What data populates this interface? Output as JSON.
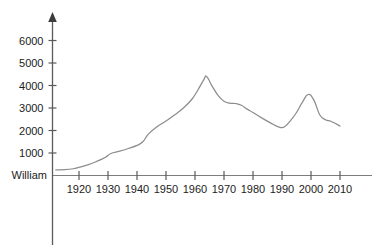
{
  "chart_data": {
    "type": "line",
    "title": "",
    "xlabel": "",
    "ylabel": "",
    "baseline_label": "William",
    "xlim": [
      1912,
      2014
    ],
    "ylim": [
      0,
      6800
    ],
    "grid": false,
    "legend": "none",
    "y_ticks": [
      1000,
      2000,
      3000,
      4000,
      5000,
      6000
    ],
    "y_tick_labels": [
      "1000",
      "2000",
      "3000",
      "4000",
      "5000",
      "6000"
    ],
    "x_ticks": [
      1920,
      1930,
      1940,
      1950,
      1960,
      1970,
      1980,
      1990,
      2000,
      2010
    ],
    "x_tick_labels": [
      "1920",
      "1930",
      "1940",
      "1950",
      "1960",
      "1970",
      "1980",
      "1990",
      "2000",
      "2010"
    ],
    "series": [
      {
        "name": "William",
        "color": "#8d8d8d",
        "x": [
          1912,
          1915,
          1918,
          1920,
          1923,
          1926,
          1929,
          1931,
          1934,
          1937,
          1940,
          1942,
          1944,
          1947,
          1950,
          1953,
          1956,
          1959,
          1961,
          1963,
          1964,
          1966,
          1968,
          1970,
          1972,
          1974,
          1976,
          1978,
          1980,
          1983,
          1986,
          1989,
          1991,
          1993,
          1995,
          1997,
          1999,
          2001,
          2003,
          2005,
          2007,
          2010
        ],
        "values": [
          250,
          260,
          300,
          360,
          470,
          620,
          800,
          980,
          1080,
          1200,
          1340,
          1500,
          1850,
          2180,
          2420,
          2700,
          3000,
          3400,
          3800,
          4250,
          4400,
          3950,
          3550,
          3300,
          3220,
          3200,
          3120,
          2950,
          2800,
          2560,
          2340,
          2150,
          2180,
          2450,
          2800,
          3250,
          3600,
          3350,
          2700,
          2480,
          2400,
          2200
        ]
      }
    ]
  },
  "axes": {
    "y_axis_name": "value-axis",
    "x_axis_name": "year-axis",
    "has_arrow_head": true
  }
}
